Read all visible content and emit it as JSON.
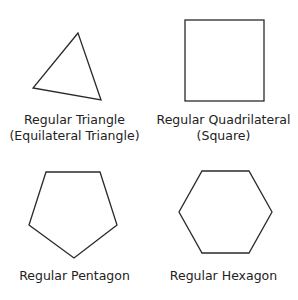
{
  "shapes": [
    {
      "id": "triangle",
      "label_line1": "Regular Triangle",
      "label_line2": "(Equilateral Triangle)",
      "sides": 3
    },
    {
      "id": "square",
      "label_line1": "Regular Quadrilateral",
      "label_line2": "(Square)",
      "sides": 4
    },
    {
      "id": "pentagon",
      "label_line1": "Regular Pentagon",
      "sides": 5
    },
    {
      "id": "hexagon",
      "label_line1": "Regular Hexagon",
      "sides": 6
    }
  ],
  "colors": {
    "stroke": "#2a2a2a",
    "background": "#ffffff"
  }
}
